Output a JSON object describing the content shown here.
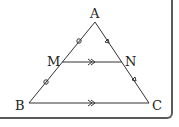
{
  "figure": {
    "type": "triangle-midsegment",
    "points": {
      "A": {
        "label": "A"
      },
      "B": {
        "label": "B"
      },
      "C": {
        "label": "C"
      },
      "M": {
        "label": "M"
      },
      "N": {
        "label": "N"
      }
    },
    "marks": {
      "AM_MB": "circle-tick",
      "AN_NC": "triangle-tick",
      "MN_BC": "double-arrow-parallel"
    },
    "colors": {
      "line": "#333333",
      "frame": "#5a5a5a"
    }
  }
}
